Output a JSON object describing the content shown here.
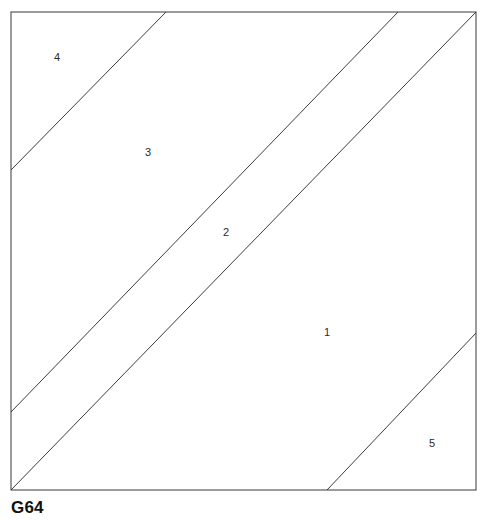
{
  "figure": {
    "caption": "G64",
    "title": "G64",
    "type": "plane-partition-diagram",
    "colors": {
      "background": "#ffffff",
      "border_stroke": "#4a4a4a",
      "cut_stroke": "#3c3c3c",
      "label_text": "#2b2b2b",
      "caption_text": "#111111"
    },
    "square": {
      "name": "outer-square",
      "x": 11,
      "y": 12,
      "width": 465,
      "height": 478
    },
    "cut_lines": [
      {
        "id": "cut-4-3",
        "separates": [
          "4",
          "3"
        ],
        "x1": 11,
        "y1": 170,
        "x2": 166,
        "y2": 12
      },
      {
        "id": "cut-3-2",
        "separates": [
          "3",
          "2"
        ],
        "x1": 11,
        "y1": 412,
        "x2": 398,
        "y2": 12
      },
      {
        "id": "cut-2-1",
        "separates": [
          "2",
          "1"
        ],
        "x1": 11,
        "y1": 490,
        "x2": 476,
        "y2": 12
      },
      {
        "id": "cut-1-5",
        "separates": [
          "1",
          "5"
        ],
        "x1": 327,
        "y1": 490,
        "x2": 476,
        "y2": 333
      }
    ],
    "regions": [
      {
        "id": "region-4",
        "label": "4",
        "x": 57,
        "y": 58
      },
      {
        "id": "region-3",
        "label": "3",
        "x": 148,
        "y": 153
      },
      {
        "id": "region-2",
        "label": "2",
        "x": 226,
        "y": 233
      },
      {
        "id": "region-1",
        "label": "1",
        "x": 327,
        "y": 333
      },
      {
        "id": "region-5",
        "label": "5",
        "x": 432,
        "y": 444
      }
    ]
  }
}
